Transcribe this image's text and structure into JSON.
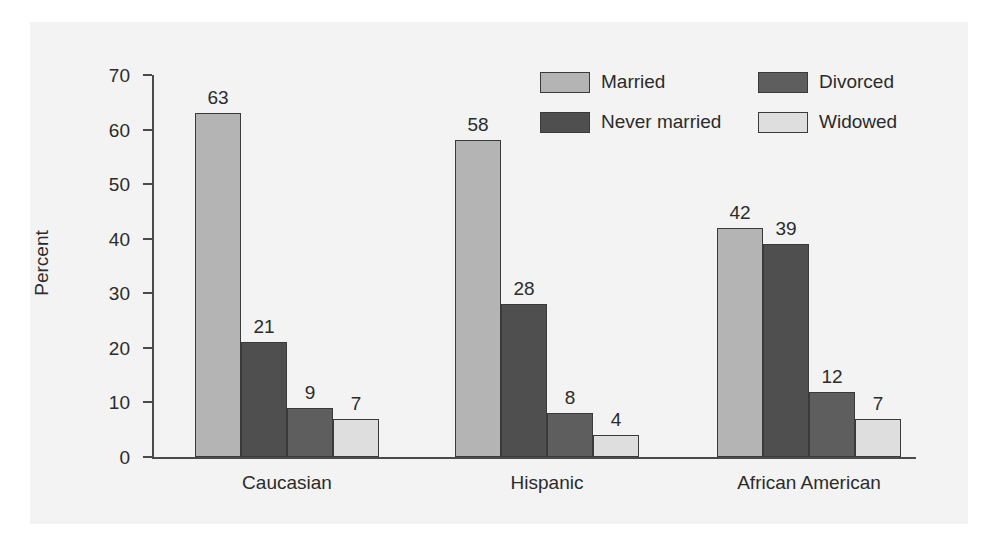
{
  "chart_data": {
    "type": "bar",
    "title": "",
    "xlabel": "",
    "ylabel": "Percent",
    "ylim": [
      0,
      70
    ],
    "yticks": [
      0,
      10,
      20,
      30,
      40,
      50,
      60,
      70
    ],
    "grid": false,
    "legend_position": "top-right",
    "categories": [
      "Caucasian",
      "Hispanic",
      "African American"
    ],
    "series": [
      {
        "name": "Married",
        "color": "#b4b4b4",
        "values": [
          63,
          58,
          42
        ]
      },
      {
        "name": "Never married",
        "color": "#4f4f4f",
        "values": [
          21,
          28,
          39
        ]
      },
      {
        "name": "Divorced",
        "color": "#5e5e5e",
        "values": [
          9,
          8,
          12
        ]
      },
      {
        "name": "Widowed",
        "color": "#dedede",
        "values": [
          7,
          4,
          7
        ]
      }
    ],
    "legend_order": [
      "Married",
      "Divorced",
      "Never married",
      "Widowed"
    ]
  },
  "axis": {
    "y_title": "Percent",
    "ticks": [
      "70",
      "60",
      "50",
      "40",
      "30",
      "20",
      "10",
      "0"
    ]
  },
  "legend": {
    "entries": [
      {
        "label": "Married"
      },
      {
        "label": "Divorced"
      },
      {
        "label": "Never married"
      },
      {
        "label": "Widowed"
      }
    ]
  },
  "groups": [
    {
      "label": "Caucasian",
      "bars": [
        {
          "series": "Married",
          "value": "63"
        },
        {
          "series": "Never married",
          "value": "21"
        },
        {
          "series": "Divorced",
          "value": "9"
        },
        {
          "series": "Widowed",
          "value": "7"
        }
      ]
    },
    {
      "label": "Hispanic",
      "bars": [
        {
          "series": "Married",
          "value": "58"
        },
        {
          "series": "Never married",
          "value": "28"
        },
        {
          "series": "Divorced",
          "value": "8"
        },
        {
          "series": "Widowed",
          "value": "4"
        }
      ]
    },
    {
      "label": "African American",
      "bars": [
        {
          "series": "Married",
          "value": "42"
        },
        {
          "series": "Never married",
          "value": "39"
        },
        {
          "series": "Divorced",
          "value": "12"
        },
        {
          "series": "Widowed",
          "value": "7"
        }
      ]
    }
  ]
}
